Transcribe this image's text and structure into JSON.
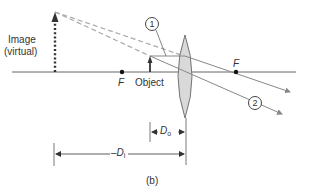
{
  "diagram": {
    "type": "optics ray diagram - converging lens, virtual image (magnifier)",
    "labels": {
      "image_line1": "Image",
      "image_line2": "(virtual)",
      "focal_left": "F",
      "focal_right": "F",
      "object": "Object",
      "ray1": "1",
      "ray2": "2",
      "d_o_prefix": "D",
      "d_o_sub": "o",
      "d_i_prefix": "–D",
      "d_i_sub": "i",
      "caption": "(b)"
    },
    "colors": {
      "axis": "#666666",
      "ray": "#888888",
      "dashed_ray": "#aaaaaa",
      "lens_fill": "#d9d9d9",
      "lens_stroke": "#666666",
      "arrow": "#333333",
      "text": "#333333"
    }
  }
}
